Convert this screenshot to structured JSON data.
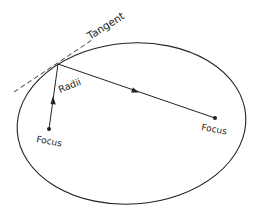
{
  "diagram": {
    "labels": {
      "tangent": "Tangent",
      "radii": "Radii",
      "focus_left": "Focus",
      "focus_right": "Focus"
    },
    "colors": {
      "stroke": "#222222",
      "background": "#ffffff"
    },
    "ellipse": {
      "cx": 131.5,
      "cy": 123.5,
      "rx": 114.5,
      "ry": 80.5,
      "rotation": -4
    },
    "points": {
      "tangent_point": [
        58,
        64
      ],
      "focus_left": [
        49,
        129
      ],
      "focus_right": [
        215,
        118
      ]
    },
    "tangent_line": {
      "from": [
        14,
        92
      ],
      "to": [
        92,
        40
      ]
    }
  }
}
